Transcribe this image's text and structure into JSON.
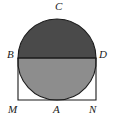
{
  "figure": {
    "colors": {
      "stroke": "#1b1b1b",
      "background": "#ffffff",
      "upper_semicircle_fill": "#4a4a4a",
      "lower_region_fill": "#8d8d8d",
      "label_color": "#1b1b1b"
    },
    "stroke_width": 1.1,
    "labels": [
      {
        "name": "label-C",
        "text": "C",
        "x": 55,
        "y": 1,
        "anchor": "top-center"
      },
      {
        "name": "label-B",
        "text": "B",
        "x": 7,
        "y": 49,
        "anchor": "left"
      },
      {
        "name": "label-D",
        "text": "D",
        "x": 99,
        "y": 49,
        "anchor": "left"
      },
      {
        "name": "label-M",
        "text": "M",
        "x": 8,
        "y": 104,
        "anchor": "left"
      },
      {
        "name": "label-A",
        "text": "A",
        "x": 53,
        "y": 104,
        "anchor": "left"
      },
      {
        "name": "label-N",
        "text": "N",
        "x": 89,
        "y": 104,
        "anchor": "left"
      }
    ],
    "geometry": {
      "rect": {
        "left": 18,
        "top": 58,
        "right": 96,
        "bottom": 100
      },
      "points": {
        "B": {
          "x": 18,
          "y": 58
        },
        "D": {
          "x": 96,
          "y": 58
        },
        "M": {
          "x": 18,
          "y": 100
        },
        "N": {
          "x": 96,
          "y": 100
        },
        "A": {
          "x": 57,
          "y": 100
        },
        "C": {
          "x": 57,
          "y": 18
        }
      },
      "semicircle": {
        "center_x": 57,
        "center_y": 58,
        "radius": 39
      },
      "arc_left": {
        "center_x": 18,
        "center_y": 100,
        "radius": 39
      },
      "arc_right": {
        "center_x": 96,
        "center_y": 100,
        "radius": 39
      }
    },
    "shapes": {
      "upper_semicircle_path": "M 18 58 A 39 39 0 0 1 96 58 Z",
      "lower_shaded_path": "M 18 58 L 96 58 A 39 39 0 0 1 57 100 A 39 39 0 0 1 18 58 Z",
      "rect_path": "M 18 58 L 96 58 L 96 100 L 18 100 Z",
      "arc_left_path": "M 18 58 A 39 39 0 0 0 57 100",
      "arc_right_path": "M 96 58 A 39 39 0 0 1 57 100"
    }
  }
}
